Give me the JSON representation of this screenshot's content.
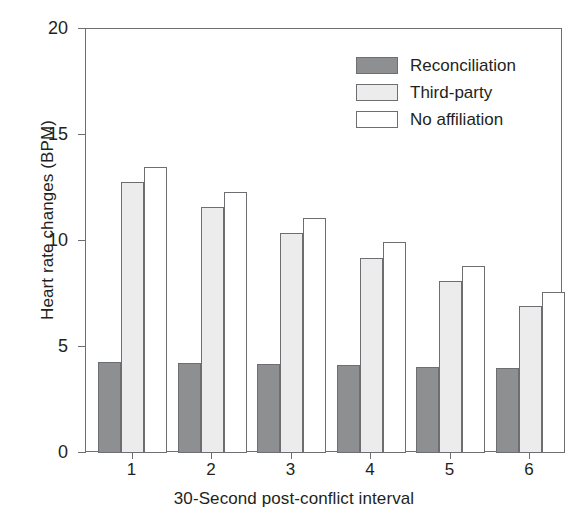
{
  "chart_data": {
    "type": "bar",
    "title": "",
    "subtitle": "",
    "xlabel": "30-Second post-conflict interval",
    "ylabel": "Heart rate changes (BPM)",
    "categories": [
      "1",
      "2",
      "3",
      "4",
      "5",
      "6"
    ],
    "series": [
      {
        "name": "Reconciliation",
        "color": "#8d8f91",
        "values": [
          4.3,
          4.25,
          4.2,
          4.15,
          4.05,
          4.0
        ]
      },
      {
        "name": "Third-party",
        "color": "#ececec",
        "values": [
          12.8,
          11.6,
          10.4,
          9.2,
          8.1,
          6.95
        ]
      },
      {
        "name": "No affiliation",
        "color": "#ffffff",
        "values": [
          13.5,
          12.3,
          11.1,
          9.95,
          8.8,
          7.6
        ]
      }
    ],
    "ylim": [
      0,
      20
    ],
    "yticks": [
      0,
      5,
      10,
      15,
      20
    ],
    "ytick_labels": [
      "0",
      "5",
      "10",
      "15",
      "20"
    ],
    "grid": false,
    "legend_position": "top-right",
    "legend_entries": [
      "Reconciliation",
      "Third-party",
      "No affiliation"
    ]
  },
  "axes": {
    "frame_color": "#6d6e71"
  }
}
